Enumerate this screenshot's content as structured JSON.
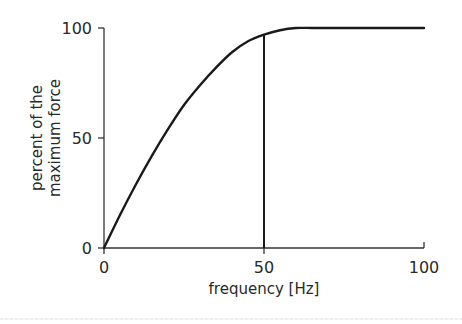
{
  "chart_data": {
    "type": "line",
    "title": "",
    "xlabel": "frequency [Hz]",
    "ylabel": [
      "percent of the",
      "maximum force"
    ],
    "xlim": [
      0,
      100
    ],
    "ylim": [
      0,
      100
    ],
    "xticks": [
      0,
      50,
      100
    ],
    "yticks": [
      0,
      50,
      100
    ],
    "grid": false,
    "legend": null,
    "series": [
      {
        "name": "force-frequency curve",
        "x": [
          0,
          5,
          10,
          15,
          20,
          25,
          30,
          35,
          40,
          45,
          50,
          55,
          60,
          65,
          70,
          80,
          90,
          100
        ],
        "y": [
          0,
          15,
          29,
          42,
          54,
          65,
          74,
          82,
          89,
          94,
          97,
          99,
          100,
          100,
          100,
          100,
          100,
          100
        ]
      }
    ],
    "annotations": [
      {
        "type": "vline",
        "x": 50,
        "y_from": 0,
        "y_to": 97,
        "label": ""
      }
    ],
    "colors": {
      "line": "#1a1a1a",
      "axis": "#333333",
      "text": "#2a2a2a"
    }
  },
  "labels": {
    "x_tick_0": "0",
    "x_tick_50": "50",
    "x_tick_100": "100",
    "y_tick_0": "0",
    "y_tick_50": "50",
    "y_tick_100": "100",
    "xlabel": "frequency [Hz]",
    "ylabel_line1": "percent of the",
    "ylabel_line2": "maximum force"
  }
}
